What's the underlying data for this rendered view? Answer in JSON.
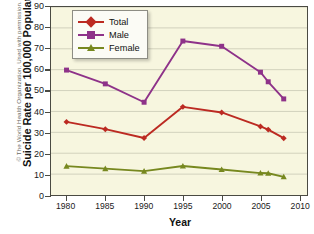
{
  "credit": "© The World Health Organization. Used with permission.",
  "chart_data": {
    "type": "line",
    "title": "",
    "xlabel": "Year",
    "ylabel": "Suicide Rate per 100,000 Population",
    "xlim": [
      1978,
      2011
    ],
    "ylim": [
      0,
      90
    ],
    "yticks": [
      0,
      10,
      20,
      30,
      40,
      50,
      60,
      70,
      80,
      90
    ],
    "xticks": [
      1980,
      1985,
      1990,
      1995,
      2000,
      2005,
      2010
    ],
    "grid": true,
    "legend_position": "top-left",
    "series": [
      {
        "name": "Total",
        "color": "#bc2a22",
        "marker": "diamond",
        "x": [
          1980,
          1985,
          1990,
          1995,
          2000,
          2005,
          2006,
          2008
        ],
        "values": [
          35.0,
          31.5,
          27.3,
          42.2,
          39.5,
          32.8,
          31.3,
          27.2
        ]
      },
      {
        "name": "Male",
        "color": "#8e3289",
        "marker": "square",
        "x": [
          1980,
          1985,
          1990,
          1995,
          2000,
          2005,
          2006,
          2008
        ],
        "values": [
          59.8,
          53.2,
          44.4,
          73.7,
          71.2,
          58.8,
          54.2,
          46.0
        ]
      },
      {
        "name": "Female",
        "color": "#77881f",
        "marker": "triangle",
        "x": [
          1980,
          1985,
          1990,
          1995,
          2000,
          2005,
          2006,
          2008
        ],
        "values": [
          13.8,
          12.6,
          11.4,
          13.9,
          12.2,
          10.5,
          10.4,
          8.7
        ]
      }
    ]
  }
}
